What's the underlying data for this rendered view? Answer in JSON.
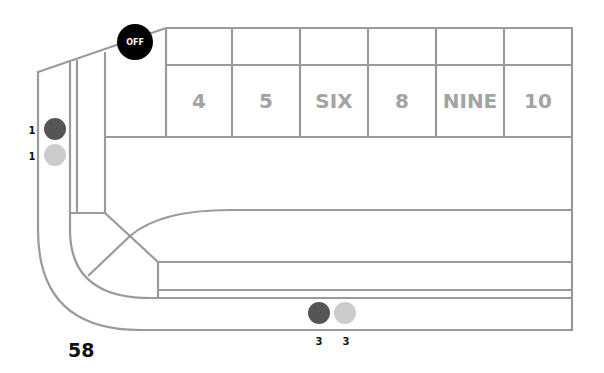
{
  "page_number": "58",
  "off_puck": {
    "label": "OFF",
    "color": "#000000"
  },
  "place_numbers": [
    "4",
    "5",
    "SIX",
    "8",
    "NINE",
    "10"
  ],
  "side_chips": [
    {
      "count": "1",
      "color": "#555555"
    },
    {
      "count": "1",
      "color": "#cccccc"
    }
  ],
  "bottom_chips": [
    {
      "count": "3",
      "color": "#555555"
    },
    {
      "count": "3",
      "color": "#cccccc"
    }
  ],
  "colors": {
    "line": "#9a9a9a",
    "number_text": "#a3a3a3",
    "dark_chip": "#555555",
    "light_chip": "#cccccc"
  }
}
